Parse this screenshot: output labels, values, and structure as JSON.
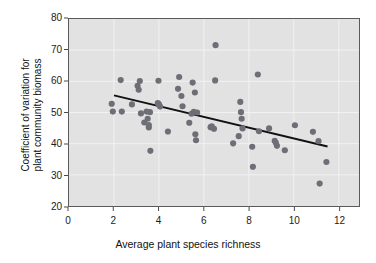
{
  "chart_data": {
    "type": "scatter",
    "title": "",
    "xlabel": "Average plant species richness",
    "ylabel_lines": [
      "Coefficient of variation for",
      "plant community biomass"
    ],
    "ylabel": "Coefficient of variation for plant community biomass",
    "xlim": [
      0,
      12.9
    ],
    "ylim": [
      20,
      80
    ],
    "xticks": [
      0,
      2,
      4,
      6,
      8,
      10,
      12
    ],
    "xtick_labels": [
      "0",
      "2",
      "4",
      "6",
      "8",
      "10",
      "12"
    ],
    "yticks": [
      20,
      30,
      40,
      50,
      60,
      70,
      80
    ],
    "ytick_labels": [
      "20",
      "30",
      "40",
      "50",
      "60",
      "70",
      "80"
    ],
    "grid": true,
    "grid_color": "#f2f2f2",
    "plot_background": "#e2e2e2",
    "point_color": "#6e6e77",
    "point_radius": 3.1,
    "legend": null,
    "x": [
      1.9,
      1.95,
      2.3,
      2.35,
      2.8,
      3.05,
      3.1,
      3.15,
      3.2,
      3.35,
      3.45,
      3.5,
      3.55,
      3.55,
      3.6,
      3.62,
      3.95,
      3.98,
      4.0,
      4.05,
      4.4,
      4.85,
      4.9,
      5.0,
      5.05,
      5.35,
      5.45,
      5.5,
      5.55,
      5.6,
      5.62,
      5.65,
      5.7,
      6.3,
      6.35,
      6.45,
      6.5,
      6.52,
      7.3,
      7.55,
      7.62,
      7.65,
      7.68,
      7.72,
      8.15,
      8.18,
      8.4,
      8.45,
      8.9,
      9.15,
      9.2,
      9.25,
      9.6,
      10.05,
      10.85,
      11.1,
      11.15,
      11.45
    ],
    "y": [
      52.8,
      50.3,
      60.4,
      50.3,
      52.6,
      58.6,
      57.3,
      60.1,
      49.7,
      46.8,
      50.3,
      48.0,
      45.2,
      46.0,
      50.1,
      37.7,
      53.0,
      60.2,
      52.6,
      51.9,
      43.9,
      57.6,
      61.4,
      55.3,
      52.0,
      46.7,
      49.6,
      59.6,
      50.2,
      56.4,
      43.0,
      41.1,
      50.0,
      45.3,
      45.6,
      44.8,
      60.3,
      71.6,
      40.1,
      42.4,
      53.4,
      50.1,
      48.0,
      44.9,
      39.0,
      32.6,
      62.2,
      44.0,
      44.9,
      40.9,
      40.3,
      39.3,
      37.9,
      45.9,
      43.8,
      40.8,
      27.2,
      34.1
    ],
    "trendline": {
      "x_start": 2.0,
      "y_start": 55.5,
      "x_end": 11.5,
      "y_end": 39.1,
      "color": "#111111"
    }
  }
}
